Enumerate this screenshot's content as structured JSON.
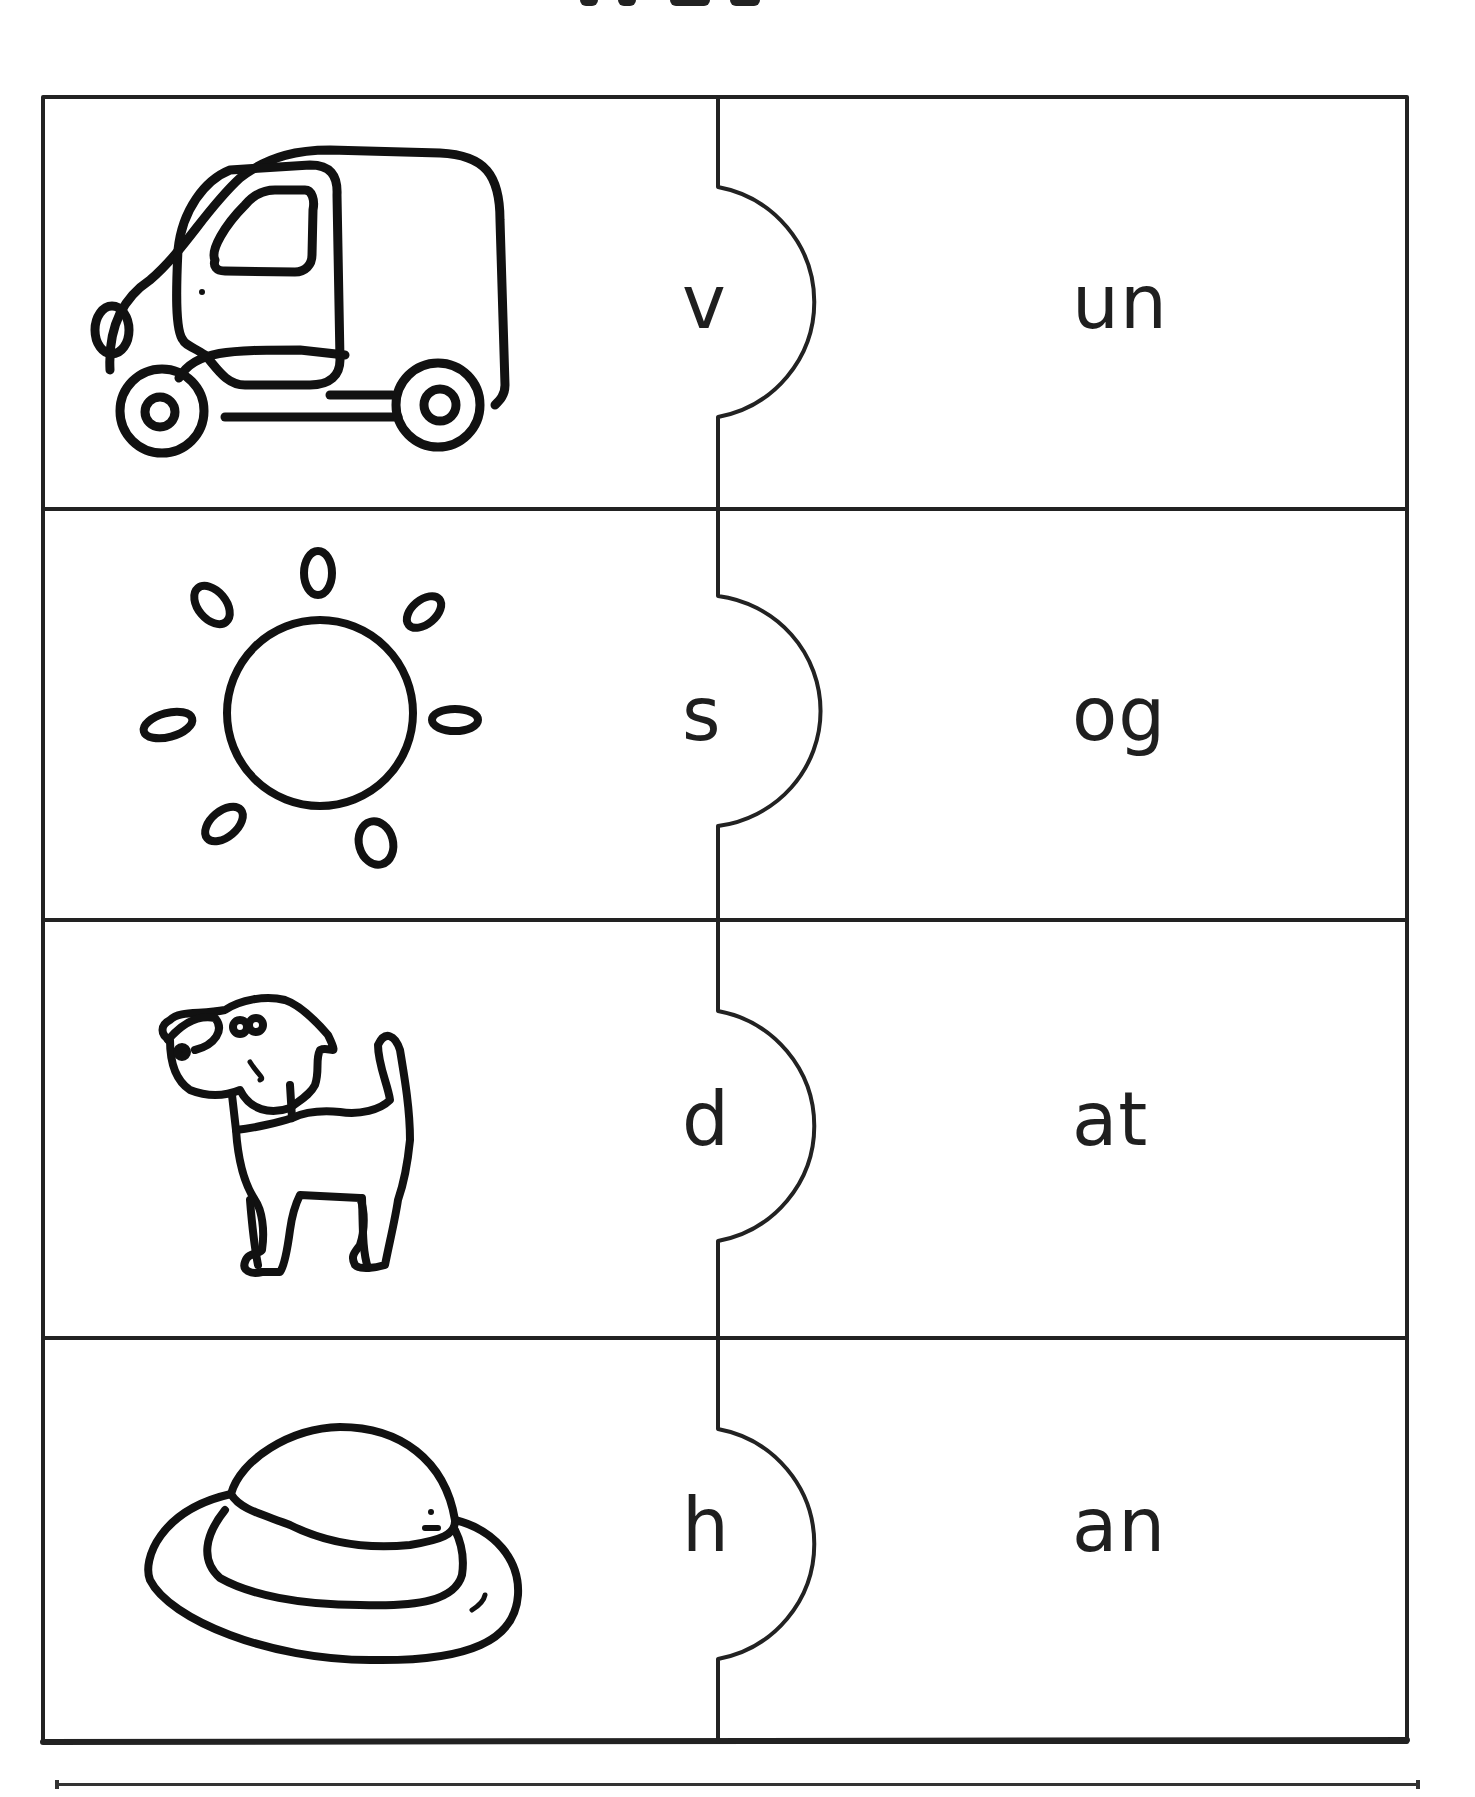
{
  "worksheet": {
    "activity": "initial sound puzzle matching",
    "rows": [
      {
        "picture": "van",
        "letter": "v",
        "word_ending": "un"
      },
      {
        "picture": "sun",
        "letter": "s",
        "word_ending": "og"
      },
      {
        "picture": "dog",
        "letter": "d",
        "word_ending": "at"
      },
      {
        "picture": "hat",
        "letter": "h",
        "word_ending": "an"
      }
    ]
  },
  "colors": {
    "ink": "#1e1e1e",
    "paper": "#ffffff"
  }
}
